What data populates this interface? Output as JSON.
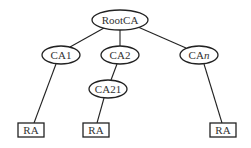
{
  "diagram": {
    "type": "tree",
    "nodes": [
      {
        "id": "root",
        "label": "RootCA",
        "shape": "ellipse",
        "cx": 120,
        "cy": 20,
        "rx": 28,
        "ry": 10
      },
      {
        "id": "ca1",
        "label": "CA1",
        "shape": "ellipse",
        "cx": 61,
        "cy": 55,
        "rx": 19,
        "ry": 9
      },
      {
        "id": "ca2",
        "label": "CA2",
        "shape": "ellipse",
        "cx": 120,
        "cy": 55,
        "rx": 19,
        "ry": 9
      },
      {
        "id": "can",
        "label": "CA",
        "label_italic_suffix": "n",
        "shape": "ellipse",
        "cx": 199,
        "cy": 55,
        "rx": 19,
        "ry": 9
      },
      {
        "id": "ca21",
        "label": "CA21",
        "shape": "ellipse",
        "cx": 108,
        "cy": 89,
        "rx": 19,
        "ry": 9
      },
      {
        "id": "ra1",
        "label": "RA",
        "shape": "rect",
        "x": 18,
        "y": 123,
        "w": 26,
        "h": 14
      },
      {
        "id": "ra2",
        "label": "RA",
        "shape": "rect",
        "x": 83,
        "y": 123,
        "w": 26,
        "h": 14
      },
      {
        "id": "ra3",
        "label": "RA",
        "shape": "rect",
        "x": 210,
        "y": 123,
        "w": 26,
        "h": 14
      }
    ],
    "edges": [
      [
        "root",
        "ca1"
      ],
      [
        "root",
        "ca2"
      ],
      [
        "root",
        "can"
      ],
      [
        "ca1",
        "ra1"
      ],
      [
        "ca2",
        "ca21"
      ],
      [
        "ca21",
        "ra2"
      ],
      [
        "can",
        "ra3"
      ]
    ]
  }
}
